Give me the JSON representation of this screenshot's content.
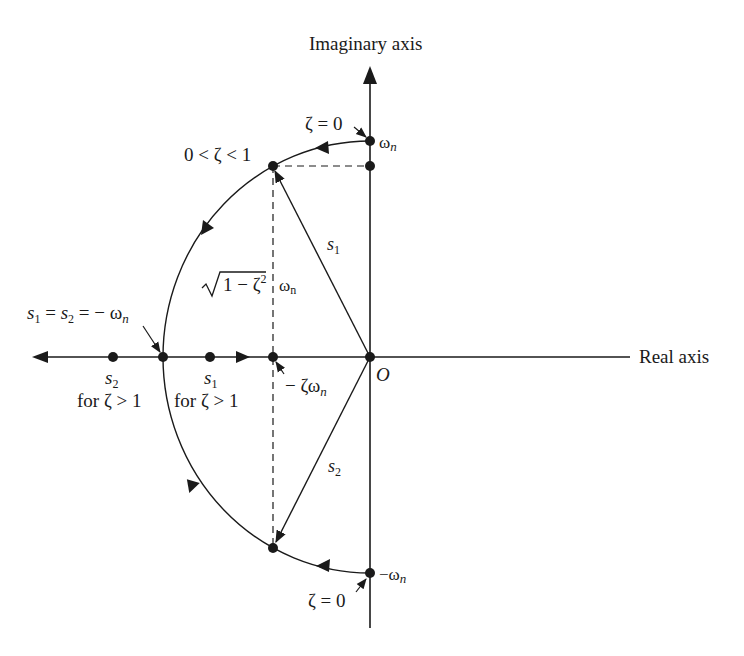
{
  "diagram": {
    "axes": {
      "imaginary_label": "Imaginary axis",
      "real_label": "Real axis",
      "origin_label": "O"
    },
    "labels": {
      "zeta_zero_top": "ζ = 0",
      "zeta_zero_bottom": "ζ = 0",
      "omega_n_top": "ω",
      "omega_n_top_sub": "n",
      "omega_n_bottom": "−ω",
      "omega_n_bottom_sub": "n",
      "underdamped": "0 < ζ < 1",
      "s1": "s",
      "s1_sub": "1",
      "s2": "s",
      "s2_sub": "2",
      "sqrt_expr": "1 − ζ",
      "sqrt_exp": "2",
      "sqrt_omega": "ω",
      "sqrt_omega_sub": "n",
      "critical_s1": "s",
      "critical_s1_sub": "1",
      "critical_eq1": " = ",
      "critical_s2": "s",
      "critical_s2_sub": "2",
      "critical_eq2": " = − ω",
      "critical_sub": "n",
      "neg_zeta_omega": "− ζω",
      "neg_zeta_omega_sub": "n",
      "overdamped_s2": "s",
      "overdamped_s2_sub": "2",
      "overdamped_s2_cond": "for ζ > 1",
      "overdamped_s1": "s",
      "overdamped_s1_sub": "1",
      "overdamped_s1_cond": "for ζ > 1"
    },
    "colors": {
      "ink": "#1a1a1a",
      "background": "#ffffff"
    }
  }
}
